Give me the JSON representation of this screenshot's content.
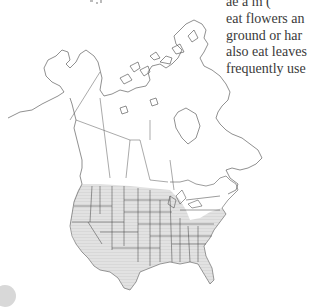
{
  "document": {
    "text_lines": [
      "ae a   m (",
      "eat flowers an",
      "ground or har",
      "also eat leaves",
      "frequently use"
    ]
  },
  "figure": {
    "type": "range map",
    "region": "North America",
    "range_fill_color": "#d9d9d9",
    "border_color": "#3c3c3c",
    "shaded_region": "Contiguous United States (western, central, and southern states)"
  }
}
